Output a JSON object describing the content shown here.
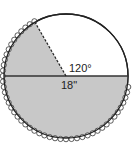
{
  "figure": {
    "type": "circle-sector-diagram",
    "angle_label": "120°",
    "diameter_label": "18\"",
    "central_angle_deg": 120,
    "diameter_in": 18,
    "colors": {
      "shaded": "#c8c8c8",
      "unshaded": "#ffffff",
      "stroke": "#222222"
    },
    "elements": {
      "horizontal_diameter": "solid line",
      "radius_at_120": "dashed line",
      "shaded_arc_edge": "scalloped trim"
    }
  }
}
